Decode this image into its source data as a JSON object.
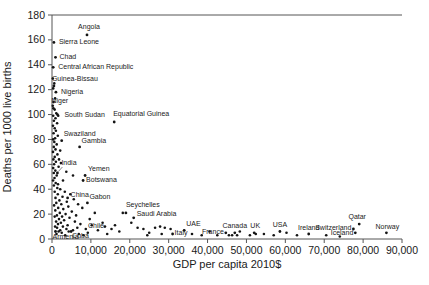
{
  "chart_data": {
    "type": "scatter",
    "title": "",
    "xlabel": "GDP per capita 2010$",
    "ylabel": "Deaths per 1000 live births",
    "xlim": [
      0,
      90000
    ],
    "ylim": [
      0,
      180
    ],
    "xticks": [
      0,
      10000,
      20000,
      30000,
      40000,
      50000,
      60000,
      70000,
      80000,
      90000
    ],
    "xtick_labels": [
      "0",
      "10,000",
      "20,000",
      "30,000",
      "40,000",
      "50,000",
      "60,000",
      "70,000",
      "80,000",
      "90,000"
    ],
    "yticks": [
      0,
      20,
      40,
      60,
      80,
      100,
      120,
      140,
      160,
      180
    ],
    "grid": false,
    "legend": false,
    "point_color": "#141414",
    "axis_color": "#555555",
    "label_color": "#1a1a1a",
    "labeled_points": [
      {
        "name": "Angola",
        "x": 9000,
        "y": 164,
        "dx": 2,
        "dy": -6,
        "anchor": "middle"
      },
      {
        "name": "Sierra Leone",
        "x": 500,
        "y": 158,
        "dx": 5,
        "dy": 2,
        "anchor": "start"
      },
      {
        "name": "Chad",
        "x": 900,
        "y": 146,
        "dx": 4,
        "dy": 2,
        "anchor": "start"
      },
      {
        "name": "Central African Republic",
        "x": 300,
        "y": 138,
        "dx": 5,
        "dy": 2,
        "anchor": "start"
      },
      {
        "name": "Guinea-Bissau",
        "x": 500,
        "y": 123,
        "dx": -2,
        "dy": -5,
        "anchor": "start"
      },
      {
        "name": "Nigeria",
        "x": 1000,
        "y": 118,
        "dx": 5,
        "dy": 2,
        "anchor": "start"
      },
      {
        "name": "Niger",
        "x": 350,
        "y": 105,
        "dx": -2,
        "dy": -5,
        "anchor": "start"
      },
      {
        "name": "South Sudan",
        "x": 1400,
        "y": 100,
        "dx": 7,
        "dy": 2,
        "anchor": "start"
      },
      {
        "name": "Equatorial Guinea",
        "x": 16000,
        "y": 94,
        "dx": -1,
        "dy": -6,
        "anchor": "start"
      },
      {
        "name": "Swaziland",
        "x": 2500,
        "y": 79,
        "dx": 2,
        "dy": -5,
        "anchor": "start"
      },
      {
        "name": "Gambia",
        "x": 7100,
        "y": 74,
        "dx": 2,
        "dy": -4,
        "anchor": "start"
      },
      {
        "name": "India",
        "x": 1400,
        "y": 53,
        "dx": 4,
        "dy": -8,
        "anchor": "start",
        "leader": true
      },
      {
        "name": "Yemen",
        "x": 8500,
        "y": 51,
        "dx": 3,
        "dy": -5,
        "anchor": "start"
      },
      {
        "name": "Botswana",
        "x": 8000,
        "y": 47,
        "dx": 3,
        "dy": 1,
        "anchor": "start"
      },
      {
        "name": "China",
        "x": 4000,
        "y": 33,
        "dx": 3,
        "dy": -1,
        "anchor": "start"
      },
      {
        "name": "Gabon",
        "x": 9100,
        "y": 29,
        "dx": 2,
        "dy": -4,
        "anchor": "start"
      },
      {
        "name": "Seychelles",
        "x": 19000,
        "y": 21,
        "dx": 0,
        "dy": -6,
        "anchor": "start"
      },
      {
        "name": "Saudi Arabia",
        "x": 21000,
        "y": 17,
        "dx": 3,
        "dy": -2,
        "anchor": "start"
      },
      {
        "name": "Chile",
        "x": 13600,
        "y": 10,
        "dx": -1,
        "dy": 1,
        "anchor": "end"
      },
      {
        "name": "Armenia",
        "x": 900,
        "y": 6,
        "dx": -3,
        "dy": 7,
        "anchor": "start"
      },
      {
        "name": "Cuba",
        "x": 4900,
        "y": 6,
        "dx": 1,
        "dy": 6,
        "anchor": "start"
      },
      {
        "name": "UAE",
        "x": 34000,
        "y": 7,
        "dx": 2,
        "dy": -4,
        "anchor": "start"
      },
      {
        "name": "Italy",
        "x": 31000,
        "y": 4,
        "dx": 2,
        "dy": 1,
        "anchor": "start"
      },
      {
        "name": "France",
        "x": 44700,
        "y": 5,
        "dx": -2,
        "dy": 1,
        "anchor": "end"
      },
      {
        "name": "Canada",
        "x": 47000,
        "y": 5,
        "dx": 0,
        "dy": -5,
        "anchor": "middle"
      },
      {
        "name": "UK",
        "x": 52000,
        "y": 5,
        "dx": 1,
        "dy": -5,
        "anchor": "middle"
      },
      {
        "name": "USA",
        "x": 58600,
        "y": 6,
        "dx": 0,
        "dy": -5,
        "anchor": "middle"
      },
      {
        "name": "Ireland",
        "x": 66000,
        "y": 4,
        "dx": 0,
        "dy": -4,
        "anchor": "middle"
      },
      {
        "name": "Switzerland",
        "x": 77500,
        "y": 8,
        "dx": -2,
        "dy": 1,
        "anchor": "end"
      },
      {
        "name": "Iceland",
        "x": 78000,
        "y": 5,
        "dx": -2,
        "dy": 2,
        "anchor": "end"
      },
      {
        "name": "Qatar",
        "x": 79000,
        "y": 12,
        "dx": -2,
        "dy": -5,
        "anchor": "middle"
      },
      {
        "name": "Norway",
        "x": 86000,
        "y": 5,
        "dx": 1,
        "dy": -4,
        "anchor": "middle"
      }
    ],
    "points": [
      [
        200,
        129
      ],
      [
        600,
        125
      ],
      [
        300,
        121
      ],
      [
        800,
        113
      ],
      [
        400,
        110
      ],
      [
        200,
        107
      ],
      [
        700,
        104
      ],
      [
        1100,
        101
      ],
      [
        300,
        99
      ],
      [
        900,
        97
      ],
      [
        1600,
        99
      ],
      [
        500,
        95
      ],
      [
        1300,
        93
      ],
      [
        250,
        91
      ],
      [
        700,
        89
      ],
      [
        1000,
        87
      ],
      [
        400,
        85
      ],
      [
        1500,
        83
      ],
      [
        800,
        81
      ],
      [
        300,
        80
      ],
      [
        600,
        78
      ],
      [
        1200,
        76
      ],
      [
        450,
        74
      ],
      [
        900,
        72
      ],
      [
        250,
        70
      ],
      [
        1400,
        68
      ],
      [
        700,
        66
      ],
      [
        350,
        64
      ],
      [
        1000,
        62
      ],
      [
        550,
        60
      ],
      [
        1700,
        58
      ],
      [
        300,
        57
      ],
      [
        850,
        55
      ],
      [
        450,
        53
      ],
      [
        1200,
        51
      ],
      [
        650,
        49
      ],
      [
        280,
        47
      ],
      [
        950,
        45
      ],
      [
        500,
        43
      ],
      [
        1350,
        41
      ],
      [
        2100,
        71
      ],
      [
        1800,
        64
      ],
      [
        2300,
        61
      ],
      [
        3680,
        54
      ],
      [
        5400,
        51
      ],
      [
        2830,
        47
      ],
      [
        1540,
        44
      ],
      [
        2100,
        40
      ],
      [
        3300,
        38
      ],
      [
        700,
        38
      ],
      [
        4700,
        36
      ],
      [
        1500,
        36
      ],
      [
        2700,
        34
      ],
      [
        900,
        33
      ],
      [
        5600,
        32
      ],
      [
        1900,
        31
      ],
      [
        3800,
        30
      ],
      [
        1100,
        29
      ],
      [
        6700,
        28
      ],
      [
        2400,
        28
      ],
      [
        550,
        27
      ],
      [
        4200,
        26
      ],
      [
        1600,
        25
      ],
      [
        7800,
        25
      ],
      [
        2900,
        24
      ],
      [
        850,
        23
      ],
      [
        5100,
        22
      ],
      [
        2000,
        21
      ],
      [
        11000,
        21
      ],
      [
        3500,
        20
      ],
      [
        1250,
        19
      ],
      [
        6200,
        19
      ],
      [
        2600,
        18
      ],
      [
        700,
        18
      ],
      [
        4500,
        17
      ],
      [
        1800,
        16
      ],
      [
        9700,
        16
      ],
      [
        3100,
        15
      ],
      [
        1050,
        14
      ],
      [
        5900,
        14
      ],
      [
        2300,
        13
      ],
      [
        13000,
        13
      ],
      [
        7300,
        12
      ],
      [
        1550,
        12
      ],
      [
        4000,
        11
      ],
      [
        10200,
        11
      ],
      [
        2800,
        10
      ],
      [
        800,
        10
      ],
      [
        6500,
        9
      ],
      [
        1300,
        9
      ],
      [
        3700,
        8
      ],
      [
        8700,
        8
      ],
      [
        15300,
        8
      ],
      [
        2100,
        7
      ],
      [
        5400,
        7
      ],
      [
        11800,
        7
      ],
      [
        1700,
        6
      ],
      [
        4300,
        6
      ],
      [
        9200,
        5
      ],
      [
        2500,
        5
      ],
      [
        6900,
        4
      ],
      [
        14200,
        4
      ],
      [
        1150,
        4
      ],
      [
        3400,
        3
      ],
      [
        8100,
        3
      ],
      [
        16200,
        11
      ],
      [
        17300,
        6
      ],
      [
        18200,
        21
      ],
      [
        20400,
        13
      ],
      [
        22000,
        9
      ],
      [
        23500,
        8
      ],
      [
        25000,
        5
      ],
      [
        26500,
        9
      ],
      [
        27800,
        10
      ],
      [
        29000,
        9
      ],
      [
        24500,
        3
      ],
      [
        28200,
        4
      ],
      [
        30500,
        8
      ],
      [
        36000,
        4
      ],
      [
        38500,
        3
      ],
      [
        40500,
        6
      ],
      [
        42500,
        3
      ],
      [
        45500,
        3
      ],
      [
        46300,
        3
      ],
      [
        47600,
        3
      ],
      [
        48300,
        6
      ],
      [
        50900,
        3
      ],
      [
        52400,
        4
      ],
      [
        54500,
        4
      ],
      [
        57000,
        3
      ],
      [
        60300,
        5
      ],
      [
        63000,
        3
      ],
      [
        70500,
        3
      ],
      [
        74000,
        2
      ]
    ]
  }
}
